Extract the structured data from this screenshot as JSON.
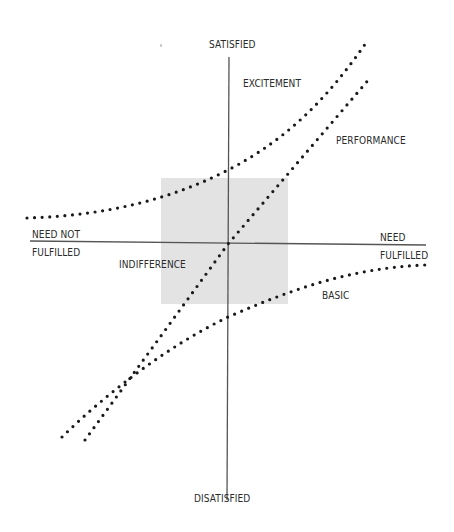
{
  "diagram": {
    "type": "kano-model",
    "axes": {
      "vertical_top": "SATISFIED",
      "vertical_bottom": "DISATISFIED",
      "horizontal_left_line1": "NEED NOT",
      "horizontal_left_line2": "FULFILLED",
      "horizontal_right_line1": "NEED",
      "horizontal_right_line2": "FULFILLED"
    },
    "regions": {
      "excitement": "EXCITEMENT",
      "performance": "PERFORMANCE",
      "basic": "BASIC",
      "indifference": "INDIFFERENCE"
    },
    "colors": {
      "axis": "#555555",
      "dots": "#1a1a1a",
      "indifference_zone": "#e3e3e3",
      "text": "#2b2b2b"
    }
  }
}
